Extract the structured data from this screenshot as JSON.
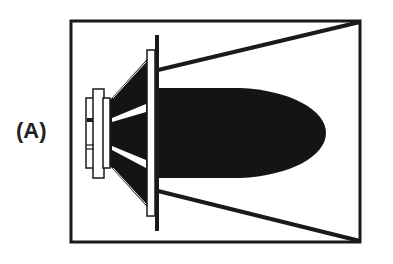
{
  "figure": {
    "panel_label": "(A)",
    "colors": {
      "ink": "#1a1a1a",
      "background": "#ffffff"
    },
    "elements": {
      "enclosure_box": "box",
      "baffle": "baffle-line",
      "driver": "speaker-driver",
      "magnet": "magnet-assembly",
      "cone": "speaker-cone",
      "coverage_lines": "dispersion-boundary-lines",
      "lobe": "radiation-lobe"
    }
  }
}
